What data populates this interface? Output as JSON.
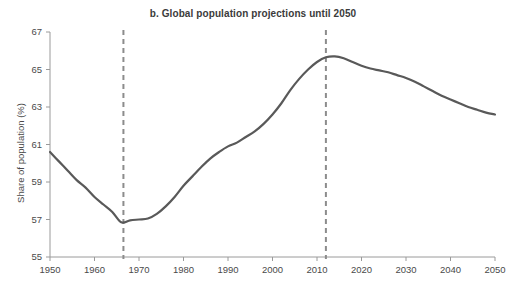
{
  "chart_data": {
    "type": "line",
    "title": "b. Global population projections until 2050",
    "xlabel": "",
    "ylabel": "Share of population (%)",
    "xlim": [
      1950,
      2050
    ],
    "ylim": [
      55,
      67
    ],
    "grid": false,
    "legend": null,
    "x_ticks": [
      "1950",
      "1960",
      "1970",
      "1980",
      "1990",
      "2000",
      "2010",
      "2020",
      "2030",
      "2040",
      "2050"
    ],
    "y_ticks": [
      "55",
      "57",
      "59",
      "61",
      "63",
      "65",
      "67"
    ],
    "line_color": "#595959",
    "annotations": [
      {
        "type": "vertical-dashed-line",
        "x": 1966.5,
        "color": "#8c8c8c"
      },
      {
        "type": "vertical-dashed-line",
        "x": 2012.0,
        "color": "#8c8c8c"
      }
    ],
    "series": [
      {
        "name": "Share of population (%)",
        "x": [
          1950,
          1952,
          1954,
          1956,
          1958,
          1960,
          1962,
          1964,
          1966,
          1968,
          1970,
          1972,
          1974,
          1976,
          1978,
          1980,
          1982,
          1984,
          1986,
          1988,
          1990,
          1992,
          1994,
          1996,
          1998,
          2000,
          2002,
          2004,
          2006,
          2008,
          2010,
          2012,
          2014,
          2016,
          2018,
          2020,
          2022,
          2024,
          2026,
          2028,
          2030,
          2032,
          2034,
          2036,
          2038,
          2040,
          2042,
          2044,
          2046,
          2048,
          2050
        ],
        "y": [
          60.6,
          60.1,
          59.6,
          59.1,
          58.7,
          58.2,
          57.8,
          57.4,
          56.85,
          56.95,
          57.0,
          57.05,
          57.3,
          57.7,
          58.2,
          58.8,
          59.3,
          59.8,
          60.25,
          60.6,
          60.9,
          61.1,
          61.4,
          61.7,
          62.1,
          62.6,
          63.2,
          63.9,
          64.5,
          65.0,
          65.4,
          65.65,
          65.7,
          65.6,
          65.4,
          65.2,
          65.05,
          64.95,
          64.85,
          64.7,
          64.55,
          64.35,
          64.1,
          63.85,
          63.6,
          63.4,
          63.2,
          63.0,
          62.85,
          62.7,
          62.6
        ]
      }
    ]
  }
}
